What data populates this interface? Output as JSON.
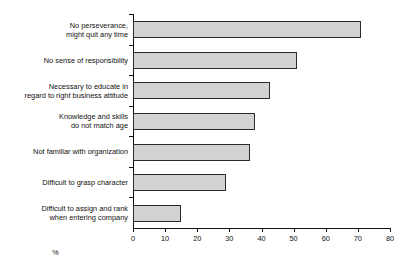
{
  "chart_data": {
    "type": "bar",
    "orientation": "horizontal",
    "title": "",
    "subtitle": "",
    "xlabel": "%",
    "ylabel": "",
    "xlim": [
      0,
      80
    ],
    "xticks": [
      0,
      10,
      20,
      30,
      40,
      50,
      60,
      70,
      80
    ],
    "xtick_labels": [
      "0",
      "10",
      "20",
      "30",
      "40",
      "50",
      "60",
      "70",
      "80"
    ],
    "grid": false,
    "legend": false,
    "legend_position": "none",
    "bar_fill_color": "#d2d2d2",
    "bar_edge_color": "#2b2b2b",
    "axis_color": "#111111",
    "background_color": "#ffffff",
    "categories": [
      "No perseverance,\nmight quit any time",
      "No sense of responsibility",
      "Necessary to educate in\nregard to right business attitude",
      "Knowledge and skills\ndo not match age",
      "Not familiar with organization",
      "Difficult to grasp character",
      "Difficult to assign and rank\nwhen entering company"
    ],
    "values": [
      71,
      51,
      42.5,
      38,
      36.5,
      29,
      15
    ]
  }
}
